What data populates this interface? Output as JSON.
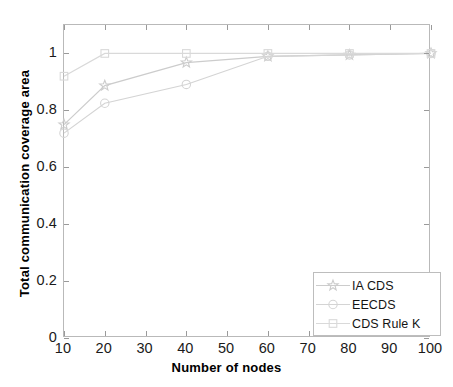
{
  "chart_data": {
    "type": "line",
    "title": "",
    "xlabel": "Number of nodes",
    "ylabel": "Total communication coverage area",
    "x": [
      10,
      20,
      40,
      60,
      80,
      100
    ],
    "xlim": [
      10,
      100
    ],
    "ylim": [
      0,
      1.1
    ],
    "xticks": [
      10,
      20,
      30,
      40,
      50,
      60,
      70,
      80,
      90,
      100
    ],
    "xticklabels": [
      "10",
      "20",
      "30",
      "40",
      "50",
      "60",
      "70",
      "80",
      "90",
      "100"
    ],
    "yticks": [
      0,
      0.2,
      0.4,
      0.6,
      0.8,
      1
    ],
    "yticklabels": [
      "0",
      "0.2",
      "0.4",
      "0.6",
      "0.8",
      "1"
    ],
    "grid": false,
    "legend_position": "lower right",
    "series": [
      {
        "name": "IA CDS",
        "marker": "star",
        "color": "#cccccc",
        "values": [
          0.75,
          0.887,
          0.968,
          0.99,
          0.995,
          1.0
        ]
      },
      {
        "name": "EECDS",
        "marker": "circle",
        "color": "#d4d4d4",
        "values": [
          0.72,
          0.825,
          0.891,
          0.99,
          0.995,
          1.0
        ]
      },
      {
        "name": "CDS Rule K",
        "marker": "square",
        "color": "#d9d9d9",
        "values": [
          0.92,
          1.0,
          1.0,
          1.0,
          1.0,
          1.0
        ]
      }
    ]
  },
  "legend": {
    "entries": [
      {
        "label": "IA CDS"
      },
      {
        "label": "EECDS"
      },
      {
        "label": "CDS Rule K"
      }
    ]
  },
  "axes": {
    "x_title": "Number of nodes",
    "y_title": "Total communication coverage area"
  },
  "colors": {
    "frame": "#b9b9b9",
    "tick": "#9a9a9a",
    "text": "#111111",
    "background": "#ffffff"
  }
}
